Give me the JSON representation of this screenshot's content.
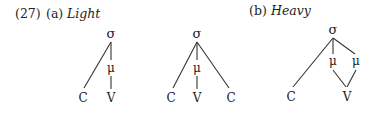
{
  "example_number": "(27)",
  "part_a": {
    "letter": "(a)",
    "title": "Light"
  },
  "part_b": {
    "letter": "(b)",
    "title": "Heavy"
  },
  "symbols": {
    "syllable": "σ",
    "mora": "μ",
    "consonant": "C",
    "vowel": "V"
  },
  "trees": [
    {
      "id": "light-cv",
      "nodes": {
        "sigma": "σ",
        "mu": "μ",
        "c1": "C",
        "v": "V"
      }
    },
    {
      "id": "light-cvc",
      "nodes": {
        "sigma": "σ",
        "mu": "μ",
        "c1": "C",
        "v": "V",
        "c2": "C"
      }
    },
    {
      "id": "heavy-cvv",
      "nodes": {
        "sigma": "σ",
        "mu1": "μ",
        "mu2": "μ",
        "c1": "C",
        "v": "V"
      }
    }
  ]
}
